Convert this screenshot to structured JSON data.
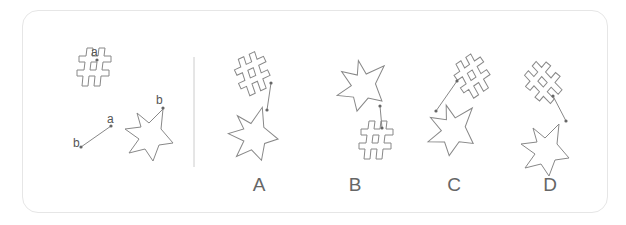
{
  "puzzle": {
    "reference": {
      "hash_point_label": "a",
      "segment_end_a_label": "a",
      "segment_end_b_label": "b",
      "star_point_label": "b"
    },
    "options": [
      {
        "label": "A"
      },
      {
        "label": "B"
      },
      {
        "label": "C"
      },
      {
        "label": "D"
      }
    ]
  }
}
